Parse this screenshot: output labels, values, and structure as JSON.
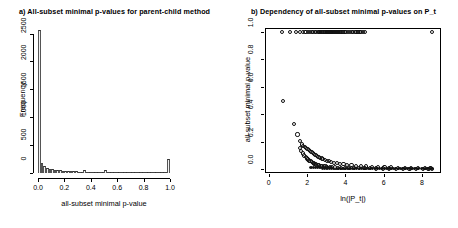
{
  "figure": {
    "panels": [
      "a",
      "b"
    ],
    "background": "#ffffff",
    "foreground": "#000000"
  },
  "chart_data": [
    {
      "type": "bar",
      "panel": "a",
      "title": "a) All-subset minimal p-values for parent-child method",
      "xlabel": "all-subset minimal p-value",
      "ylabel": "Frequency",
      "xlim": [
        0,
        1.0
      ],
      "ylim": [
        0,
        2600
      ],
      "xticks": [
        0.0,
        0.2,
        0.4,
        0.6,
        0.8,
        1.0
      ],
      "xticklabels": [
        "0.0",
        "0.2",
        "0.4",
        "0.6",
        "0.8",
        "1.0"
      ],
      "yticks": [
        0,
        500,
        1000,
        1500,
        2000,
        2500
      ],
      "yticklabels": [
        "0",
        "500",
        "1000",
        "1500",
        "2000",
        "2500"
      ],
      "grid": false,
      "legend": false,
      "bin_width": 0.02,
      "categories": [
        "0.00",
        "0.02",
        "0.04",
        "0.06",
        "0.08",
        "0.10",
        "0.12",
        "0.14",
        "0.16",
        "0.18",
        "0.20",
        "0.22",
        "0.24",
        "0.26",
        "0.28",
        "0.30",
        "0.32",
        "0.34",
        "0.36",
        "0.38",
        "0.40",
        "0.42",
        "0.44",
        "0.46",
        "0.48",
        "0.50",
        "0.52",
        "0.54",
        "0.56",
        "0.58",
        "0.60",
        "0.62",
        "0.64",
        "0.66",
        "0.68",
        "0.70",
        "0.72",
        "0.74",
        "0.76",
        "0.78",
        "0.80",
        "0.82",
        "0.84",
        "0.86",
        "0.88",
        "0.90",
        "0.92",
        "0.94",
        "0.96",
        "0.98"
      ],
      "values": [
        2560,
        180,
        120,
        95,
        80,
        70,
        62,
        55,
        50,
        45,
        42,
        38,
        34,
        30,
        28,
        26,
        24,
        58,
        20,
        18,
        17,
        16,
        15,
        14,
        13,
        62,
        12,
        11,
        10,
        10,
        9,
        9,
        8,
        8,
        7,
        7,
        6,
        6,
        6,
        5,
        5,
        5,
        4,
        4,
        4,
        3,
        3,
        3,
        3,
        255
      ]
    },
    {
      "type": "scatter",
      "panel": "b",
      "title": "b) Dependency of all-subset minimal p-values on P_t",
      "xlabel": "ln(|P_t|)",
      "ylabel": "all-subset minimal p-value",
      "xlim": [
        -0.2,
        9.0
      ],
      "ylim": [
        -0.03,
        1.03
      ],
      "xticks": [
        0,
        2,
        4,
        6,
        8
      ],
      "xticklabels": [
        "0",
        "2",
        "4",
        "6",
        "8"
      ],
      "yticks": [
        0.0,
        0.2,
        0.4,
        0.6,
        0.8,
        1.0
      ],
      "yticklabels": [
        "0.0",
        "0.2",
        "0.4",
        "0.6",
        "0.8",
        "1.0"
      ],
      "grid": false,
      "legend": false,
      "marker": "open-circle",
      "series": [
        {
          "name": "saturated at one",
          "marker": "open-circle",
          "x": [
            0.7,
            1.1,
            1.4,
            1.62,
            1.78,
            1.92,
            2.05,
            2.15,
            2.25,
            2.33,
            2.41,
            2.48,
            2.55,
            2.62,
            2.68,
            2.74,
            2.8,
            2.86,
            2.92,
            2.97,
            3.02,
            3.07,
            3.12,
            3.17,
            3.22,
            3.27,
            3.32,
            3.37,
            3.42,
            3.47,
            3.52,
            3.57,
            3.62,
            3.68,
            3.74,
            3.8,
            3.88,
            3.96,
            4.05,
            4.14,
            4.24,
            4.33,
            4.42,
            4.5,
            4.58,
            4.66,
            4.74,
            4.82,
            4.92,
            5.02,
            8.52
          ],
          "y": [
            1.0,
            1.0,
            1.0,
            1.0,
            1.0,
            1.0,
            1.0,
            1.0,
            1.0,
            1.0,
            1.0,
            1.0,
            1.0,
            1.0,
            1.0,
            1.0,
            1.0,
            1.0,
            1.0,
            1.0,
            1.0,
            1.0,
            1.0,
            1.0,
            1.0,
            1.0,
            1.0,
            1.0,
            1.0,
            1.0,
            1.0,
            1.0,
            1.0,
            1.0,
            1.0,
            1.0,
            1.0,
            1.0,
            1.0,
            1.0,
            1.0,
            1.0,
            1.0,
            1.0,
            1.0,
            1.0,
            1.0,
            1.0,
            1.0,
            1.0,
            1.0
          ]
        },
        {
          "name": "upper decay branch",
          "marker": "open-circle",
          "x": [
            0.72,
            1.32,
            1.5,
            1.62,
            1.72,
            1.8,
            1.88,
            1.95,
            2.02,
            2.09,
            2.16,
            2.23,
            2.3,
            2.37,
            2.44,
            2.52,
            2.6,
            2.68,
            2.76,
            2.85,
            2.94,
            3.04,
            3.15,
            3.27,
            3.4,
            3.55,
            3.72,
            3.9,
            4.1,
            4.32,
            4.56,
            4.82,
            5.1,
            5.4,
            5.72,
            6.05,
            6.4,
            6.75,
            7.1,
            7.45,
            7.8,
            8.15,
            8.45
          ],
          "y": [
            0.495,
            0.33,
            0.252,
            0.205,
            0.178,
            0.168,
            0.158,
            0.15,
            0.143,
            0.136,
            0.129,
            0.122,
            0.115,
            0.108,
            0.101,
            0.094,
            0.088,
            0.082,
            0.076,
            0.07,
            0.065,
            0.06,
            0.055,
            0.05,
            0.045,
            0.041,
            0.037,
            0.033,
            0.029,
            0.026,
            0.023,
            0.02,
            0.018,
            0.016,
            0.014,
            0.012,
            0.01,
            0.009,
            0.008,
            0.007,
            0.006,
            0.005,
            0.004
          ]
        },
        {
          "name": "lower decay branch",
          "marker": "open-circle",
          "x": [
            1.62,
            1.7,
            1.78,
            1.86,
            1.93,
            2.0,
            2.06,
            2.12,
            2.18,
            2.24,
            2.3,
            2.36,
            2.42,
            2.48,
            2.55,
            2.62,
            2.7,
            2.78,
            2.87,
            2.96,
            3.06,
            3.18,
            3.3,
            3.44,
            3.6,
            3.78,
            3.98,
            4.2,
            4.45,
            4.72,
            5.0,
            5.3,
            5.62,
            5.95,
            6.3,
            6.65,
            7.0,
            7.35,
            7.7,
            8.05,
            8.35,
            8.55
          ],
          "y": [
            0.152,
            0.13,
            0.112,
            0.098,
            0.086,
            0.076,
            0.068,
            0.061,
            0.055,
            0.049,
            0.044,
            0.04,
            0.036,
            0.032,
            0.029,
            0.026,
            0.023,
            0.021,
            0.019,
            0.017,
            0.015,
            0.013,
            0.012,
            0.01,
            0.009,
            0.008,
            0.007,
            0.006,
            0.005,
            0.005,
            0.004,
            0.004,
            0.003,
            0.003,
            0.003,
            0.002,
            0.002,
            0.002,
            0.002,
            0.001,
            0.001,
            0.001
          ]
        },
        {
          "name": "dense baseline",
          "marker": "filled-circle",
          "x": [
            2.2,
            2.32,
            2.44,
            2.56,
            2.68,
            2.8,
            2.92,
            3.04,
            3.16,
            3.28,
            3.4,
            3.52,
            3.64,
            3.76,
            3.88,
            4.0,
            4.12,
            4.24,
            4.36,
            4.48,
            4.6,
            4.72,
            4.84,
            4.96,
            5.08,
            5.2,
            5.32,
            5.44,
            5.56,
            5.68,
            5.8,
            5.92,
            6.04,
            6.16,
            6.28,
            6.4,
            6.52,
            6.64,
            6.76,
            6.88,
            7.0,
            7.12,
            7.24,
            7.36,
            7.48,
            7.6,
            7.72,
            7.84,
            7.96,
            8.08,
            8.2,
            8.32,
            8.44,
            8.56
          ],
          "y": [
            0.01,
            0.009,
            0.009,
            0.008,
            0.008,
            0.007,
            0.007,
            0.006,
            0.006,
            0.006,
            0.005,
            0.005,
            0.005,
            0.004,
            0.004,
            0.004,
            0.004,
            0.003,
            0.003,
            0.003,
            0.003,
            0.003,
            0.003,
            0.002,
            0.002,
            0.002,
            0.002,
            0.002,
            0.002,
            0.002,
            0.002,
            0.002,
            0.002,
            0.001,
            0.001,
            0.001,
            0.001,
            0.001,
            0.001,
            0.001,
            0.001,
            0.001,
            0.001,
            0.001,
            0.001,
            0.001,
            0.001,
            0.001,
            0.001,
            0.001,
            0.001,
            0.001,
            0.001,
            0.001
          ]
        }
      ]
    }
  ]
}
